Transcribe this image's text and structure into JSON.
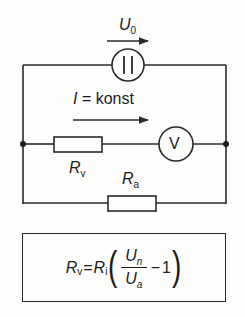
{
  "diagram": {
    "labels": {
      "source_voltage": {
        "symbol": "U",
        "subscript": "0"
      },
      "current": {
        "text": "I = konst",
        "symbol": "I",
        "rest": " = konst"
      },
      "series_resistor": {
        "symbol": "R",
        "subscript": "v"
      },
      "load_resistor": {
        "symbol": "R",
        "subscript": "a"
      },
      "voltmeter": "V",
      "source_glyph": "||"
    },
    "formula": {
      "lhs": {
        "symbol": "R",
        "subscript": "v"
      },
      "equals": "=",
      "factor": {
        "symbol": "R",
        "subscript": "i"
      },
      "numerator": {
        "symbol": "U",
        "subscript": "n"
      },
      "denominator": {
        "symbol": "U",
        "subscript": "a"
      },
      "minus": "−",
      "one": "1",
      "open_paren": "(",
      "close_paren": ")"
    },
    "colors": {
      "line": "#2a2a2a",
      "background": "#fdfdfb"
    }
  }
}
